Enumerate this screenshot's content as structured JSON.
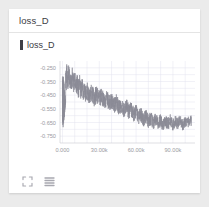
{
  "panel": {
    "title": "loss_D",
    "legend": {
      "label": "loss_D",
      "marker_color": "#3f3f46"
    },
    "toolbar": {
      "expand_icon": "fullscreen-expand-icon",
      "menu_icon": "list-menu-icon"
    },
    "card_background": "#ffffff",
    "page_background": "#ebebeb"
  },
  "chart_data": {
    "type": "line",
    "title": "loss_D",
    "xlabel": "",
    "ylabel": "",
    "series": [
      {
        "name": "loss_D",
        "color": "#8a8a95"
      }
    ],
    "x_ticks": [
      "0.000",
      "30.00k",
      "60.00k",
      "90.00k"
    ],
    "x_tick_values": [
      0,
      30000,
      60000,
      90000
    ],
    "y_ticks": [
      "-0.250",
      "-0.350",
      "-0.450",
      "-0.550",
      "-0.650",
      "-0.750"
    ],
    "y_tick_values": [
      -0.25,
      -0.35,
      -0.45,
      -0.55,
      -0.65,
      -0.75
    ],
    "xlim": [
      -2000,
      108000
    ],
    "ylim": [
      -0.8,
      -0.2
    ],
    "grid": true,
    "legend_position": "top-left",
    "x": [
      0,
      500,
      1000,
      1500,
      2000,
      2500,
      3000,
      3500,
      4000,
      4500,
      5000,
      6000,
      7000,
      8000,
      9000,
      10000,
      11000,
      12000,
      13000,
      14000,
      15000,
      16000,
      17000,
      18000,
      19000,
      20000,
      22000,
      24000,
      26000,
      28000,
      30000,
      32000,
      34000,
      36000,
      38000,
      40000,
      42000,
      44000,
      46000,
      48000,
      50000,
      52000,
      54000,
      56000,
      58000,
      60000,
      62000,
      64000,
      66000,
      68000,
      70000,
      72000,
      74000,
      76000,
      78000,
      80000,
      82000,
      84000,
      86000,
      88000,
      90000,
      92000,
      94000,
      96000,
      98000,
      100000,
      102000,
      104000,
      105000
    ],
    "values": [
      -0.23,
      -0.79,
      -0.3,
      -0.76,
      -0.34,
      -0.29,
      -0.37,
      -0.28,
      -0.31,
      -0.35,
      -0.3,
      -0.33,
      -0.37,
      -0.31,
      -0.36,
      -0.34,
      -0.39,
      -0.35,
      -0.41,
      -0.36,
      -0.42,
      -0.38,
      -0.44,
      -0.4,
      -0.45,
      -0.41,
      -0.46,
      -0.43,
      -0.47,
      -0.44,
      -0.48,
      -0.46,
      -0.5,
      -0.47,
      -0.51,
      -0.49,
      -0.53,
      -0.5,
      -0.54,
      -0.52,
      -0.56,
      -0.53,
      -0.57,
      -0.55,
      -0.59,
      -0.57,
      -0.61,
      -0.59,
      -0.63,
      -0.6,
      -0.64,
      -0.62,
      -0.65,
      -0.63,
      -0.66,
      -0.63,
      -0.67,
      -0.64,
      -0.66,
      -0.63,
      -0.67,
      -0.64,
      -0.66,
      -0.63,
      -0.67,
      -0.64,
      -0.65,
      -0.63,
      -0.64
    ]
  }
}
